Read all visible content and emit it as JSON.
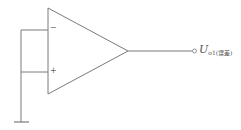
{
  "diagram": {
    "type": "op-amp-circuit",
    "components": {
      "op_amp": {
        "inverting_label": "−",
        "non_inverting_label": "+"
      },
      "ground": {
        "symbol": "ground"
      },
      "output": {
        "label_main": "U",
        "label_sub": "o1(误差)"
      }
    },
    "colors": {
      "stroke": "#777777",
      "text": "#555555",
      "background": "#ffffff"
    }
  }
}
